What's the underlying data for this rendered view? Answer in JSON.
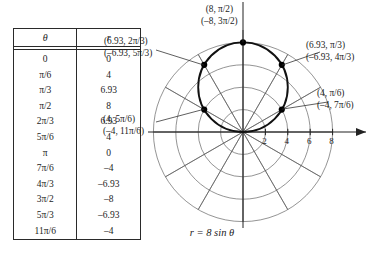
{
  "table": {
    "headers": [
      "θ",
      "r"
    ],
    "rows": [
      {
        "theta": "0",
        "r": "0"
      },
      {
        "theta": "π/6",
        "r": "4"
      },
      {
        "theta": "π/3",
        "r": "6.93"
      },
      {
        "theta": "π/2",
        "r": "8"
      },
      {
        "theta": "2π/3",
        "r": "6.93"
      },
      {
        "theta": "5π/6",
        "r": "4"
      },
      {
        "theta": "π",
        "r": "0"
      },
      {
        "theta": "7π/6",
        "r": "–4"
      },
      {
        "theta": "4π/3",
        "r": "–6.93"
      },
      {
        "theta": "3π/2",
        "r": "–8"
      },
      {
        "theta": "5π/3",
        "r": "–6.93"
      },
      {
        "theta": "11π/6",
        "r": "–4"
      }
    ]
  },
  "caption": "r = 8 sin θ",
  "labels": {
    "top": {
      "line1": "(8, π/2)",
      "line2": "(–8, 3π/2)"
    },
    "upper_left": {
      "line1": "(6.93, 2π/3)",
      "line2": "(–6.93, 5π/3)"
    },
    "upper_right": {
      "line1": "(6.93, π/3)",
      "line2": "(–6.93, 4π/3)"
    },
    "lower_left": {
      "line1": "(4, 5π/6)",
      "line2": "(–4, 11π/6)"
    },
    "lower_right": {
      "line1": "(4, π/6)",
      "line2": "(–4, 7π/6)"
    }
  },
  "axis": {
    "ticks": [
      "2",
      "4",
      "6",
      "8"
    ],
    "tick_values": [
      2,
      4,
      6,
      8
    ]
  },
  "colors": {
    "curve": "#111111",
    "grid": "#555555",
    "axis": "#222222",
    "marker": "#000000",
    "table_border": "#2a2a2a",
    "background": "#ffffff"
  },
  "chart_data": {
    "type": "line",
    "title": "r = 8 sin θ",
    "coordinate_system": "polar",
    "equation": "r = 8 sin(theta)",
    "xlabel": "",
    "ylabel": "",
    "grid": true,
    "legend": false,
    "radial_ticks": [
      2,
      4,
      6,
      8
    ],
    "angular_spokes_deg": [
      0,
      30,
      60,
      90,
      120,
      150,
      180,
      210,
      240,
      270,
      300,
      330
    ],
    "theta_deg": [
      0,
      30,
      60,
      90,
      120,
      150,
      180,
      210,
      240,
      270,
      300,
      330
    ],
    "theta_labels": [
      "0",
      "π/6",
      "π/3",
      "π/2",
      "2π/3",
      "5π/6",
      "π",
      "7π/6",
      "4π/3",
      "3π/2",
      "5π/3",
      "11π/6"
    ],
    "r_values": [
      0,
      4,
      6.93,
      8,
      6.93,
      4,
      0,
      -4,
      -6.93,
      -8,
      -6.93,
      -4
    ],
    "marked_points": [
      {
        "r": 8,
        "theta": "π/2",
        "theta_deg": 90,
        "alt_r": -8,
        "alt_theta": "3π/2"
      },
      {
        "r": 6.93,
        "theta": "2π/3",
        "theta_deg": 120,
        "alt_r": -6.93,
        "alt_theta": "5π/3"
      },
      {
        "r": 6.93,
        "theta": "π/3",
        "theta_deg": 60,
        "alt_r": -6.93,
        "alt_theta": "4π/3"
      },
      {
        "r": 4,
        "theta": "5π/6",
        "theta_deg": 150,
        "alt_r": -4,
        "alt_theta": "11π/6"
      },
      {
        "r": 4,
        "theta": "π/6",
        "theta_deg": 30,
        "alt_r": -4,
        "alt_theta": "7π/6"
      }
    ],
    "shape": "circle of diameter 8 centered at (0,4), tangent to polar axis at the pole"
  }
}
